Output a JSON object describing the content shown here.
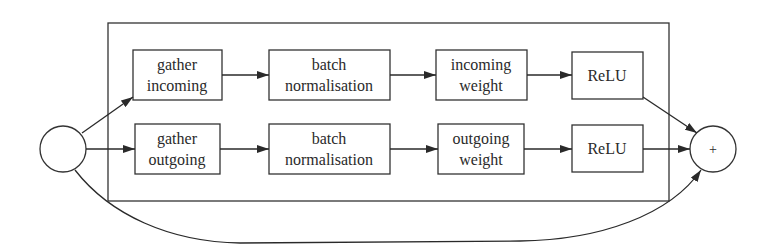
{
  "diagram": {
    "input_node": {
      "label": ""
    },
    "output_node": {
      "label": "+"
    },
    "top_row": [
      {
        "line1": "gather",
        "line2": "incoming"
      },
      {
        "line1": "batch",
        "line2": "normalisation"
      },
      {
        "line1": "incoming",
        "line2": "weight"
      },
      {
        "line1": "ReLU",
        "line2": ""
      }
    ],
    "bottom_row": [
      {
        "line1": "gather",
        "line2": "outgoing"
      },
      {
        "line1": "batch",
        "line2": "normalisation"
      },
      {
        "line1": "outgoing",
        "line2": "weight"
      },
      {
        "line1": "ReLU",
        "line2": ""
      }
    ],
    "colors": {
      "stroke": "#2a2a2a",
      "background": "#ffffff"
    }
  }
}
